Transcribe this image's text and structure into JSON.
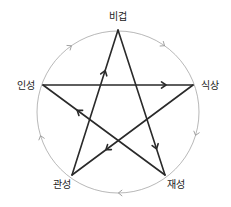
{
  "diagram": {
    "nodes": [
      {
        "id": "bigeop",
        "label": "비겁"
      },
      {
        "id": "siksang",
        "label": "식상"
      },
      {
        "id": "jaeseong",
        "label": "재성"
      },
      {
        "id": "gwanseong",
        "label": "관성"
      },
      {
        "id": "inseong",
        "label": "인성"
      }
    ],
    "cycle_edges": [
      {
        "from": "bigeop",
        "to": "siksang",
        "type": "generating"
      },
      {
        "from": "siksang",
        "to": "jaeseong",
        "type": "generating"
      },
      {
        "from": "jaeseong",
        "to": "gwanseong",
        "type": "generating"
      },
      {
        "from": "gwanseong",
        "to": "inseong",
        "type": "generating"
      },
      {
        "from": "inseong",
        "to": "bigeop",
        "type": "generating"
      }
    ],
    "star_edges": [
      {
        "from": "inseong",
        "to": "siksang",
        "type": "controlling"
      },
      {
        "from": "bigeop",
        "to": "jaeseong",
        "type": "controlling"
      },
      {
        "from": "siksang",
        "to": "gwanseong",
        "type": "controlling"
      },
      {
        "from": "jaeseong",
        "to": "inseong",
        "type": "controlling"
      },
      {
        "from": "gwanseong",
        "to": "bigeop",
        "type": "controlling"
      }
    ],
    "colors": {
      "star": "#2a2a2a",
      "circle": "#9a9a9a",
      "text": "#222222"
    }
  }
}
